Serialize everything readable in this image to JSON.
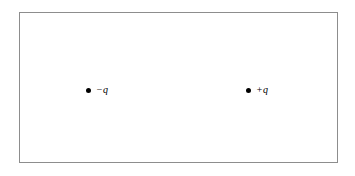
{
  "figure": {
    "type": "physics-diagram",
    "background_color": "#ffffff",
    "frame": {
      "border_color": "#8d8d8d",
      "border_width_px": 1,
      "fill_color": "#ffffff"
    },
    "charges": [
      {
        "id": "negative-charge",
        "label": "−q",
        "sign": "negative",
        "marker": "filled-circle",
        "marker_color": "#000000",
        "position": {
          "x_px": 86,
          "y_px": 87
        }
      },
      {
        "id": "positive-charge",
        "label": "+q",
        "sign": "positive",
        "marker": "filled-circle",
        "marker_color": "#000000",
        "position": {
          "x_px": 246,
          "y_px": 87
        }
      }
    ]
  }
}
